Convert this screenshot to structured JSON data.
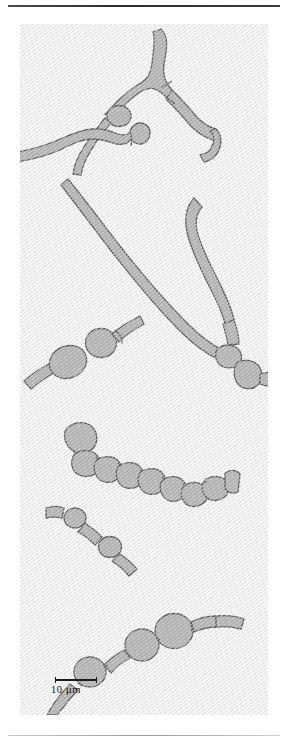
{
  "figure": {
    "type": "micrograph-illustration",
    "background_color": "#f6f6f6",
    "cell_fill_color": "#b3b3b3",
    "cell_outline_color": "#5f5f5f",
    "rule_top_color": "#2e2e2e",
    "rule_bottom_color": "#9a9a9a"
  },
  "scalebar": {
    "label": "10 µm",
    "value": 10,
    "unit": "µm",
    "bar_length_px": 42,
    "color": "#1c1c1c"
  },
  "specimens": [
    {
      "id": "branched-filament-top-right",
      "description": "Y-shaped branching filament with bulbous swelling on left branch"
    },
    {
      "id": "wavy-filament-left",
      "description": "Wavy filament entering from left edge with clubbed hooked tip"
    },
    {
      "id": "long-diagonal-filament",
      "description": "Long smooth filament running upper-left to lower-right"
    },
    {
      "id": "curved-filament-right",
      "description": "Curved filament descending to a segmented junction"
    },
    {
      "id": "two-cell-chain-mid-left",
      "description": "Chain with two large round cells and thin terminal filaments"
    },
    {
      "id": "beaded-chain-middle",
      "description": "Segmented chain of about ten cells curving down to the right"
    },
    {
      "id": "short-chain-lower-left",
      "description": "Short chain with two round swellings joined by narrow segments"
    },
    {
      "id": "large-cell-chain-bottom",
      "description": "Chain of three to four large round cells rising diagonally"
    }
  ]
}
